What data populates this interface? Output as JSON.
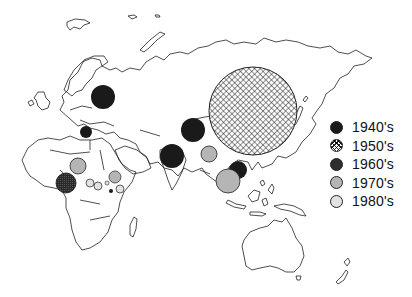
{
  "colors": {
    "1940s": "#1a1a1a",
    "1950s": "hatch",
    "1960s": "#2e2e2e",
    "1970s": "#b5b5b5",
    "1980s": "#e2e2e2",
    "outline": "#222222"
  },
  "legend": {
    "items": [
      {
        "label": "1940's",
        "style": "solid-black"
      },
      {
        "label": "1950's",
        "style": "cross-hatch"
      },
      {
        "label": "1960's",
        "style": "dark-stipple"
      },
      {
        "label": "1970's",
        "style": "mid-gray"
      },
      {
        "label": "1980's",
        "style": "light-gray"
      }
    ]
  },
  "markers": [
    {
      "region": "western-russia",
      "decade": "1940's",
      "cx": 103,
      "cy": 97,
      "r": 12
    },
    {
      "region": "balkans",
      "decade": "1940's",
      "cx": 86,
      "cy": 132,
      "r": 6
    },
    {
      "region": "central-asia",
      "decade": "1940's",
      "cx": 193,
      "cy": 130,
      "r": 12
    },
    {
      "region": "india",
      "decade": "1940's",
      "cx": 172,
      "cy": 156,
      "r": 12
    },
    {
      "region": "china",
      "decade": "1950's",
      "cx": 253,
      "cy": 111,
      "r": 44
    },
    {
      "region": "indochina",
      "decade": "1940's",
      "cx": 238,
      "cy": 170,
      "r": 9
    },
    {
      "region": "southeast-asia",
      "decade": "1970's",
      "cx": 228,
      "cy": 181,
      "r": 12
    },
    {
      "region": "myanmar",
      "decade": "1970's",
      "cx": 209,
      "cy": 154,
      "r": 8
    },
    {
      "region": "west-africa",
      "decade": "1960's",
      "cx": 66,
      "cy": 183,
      "r": 10
    },
    {
      "region": "sahel",
      "decade": "1970's",
      "cx": 78,
      "cy": 166,
      "r": 8
    },
    {
      "region": "central-africa-1",
      "decade": "1980's",
      "cx": 90,
      "cy": 183,
      "r": 4
    },
    {
      "region": "central-africa-2",
      "decade": "1980's",
      "cx": 98,
      "cy": 186,
      "r": 4
    },
    {
      "region": "ethiopia",
      "decade": "1970's",
      "cx": 115,
      "cy": 177,
      "r": 6
    },
    {
      "region": "horn-africa",
      "decade": "1980's",
      "cx": 120,
      "cy": 189,
      "r": 4
    },
    {
      "region": "east-africa-small",
      "decade": "1960's",
      "cx": 111,
      "cy": 191,
      "r": 2
    },
    {
      "region": "east-africa-2",
      "decade": "1980's",
      "cx": 107,
      "cy": 183,
      "r": 2
    }
  ]
}
